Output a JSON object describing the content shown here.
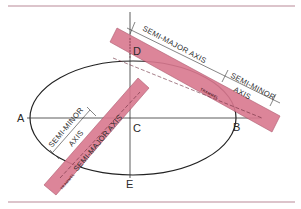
{
  "figure": {
    "colors": {
      "rule": "#b98a98",
      "trammel_fill": "#d9788f",
      "trammel_edge": "#a44a60",
      "ink": "#2a2a2a"
    }
  },
  "points": {
    "A": "A",
    "B": "B",
    "C": "C",
    "D": "D",
    "E": "E"
  },
  "upper_trammel": {
    "label": "TRAMMEL",
    "dim_semi_major": "SEMI-MAJOR AXIS",
    "dim_semi_minor_line1": "SEMI-MINOR",
    "dim_semi_minor_line2": "AXIS"
  },
  "lower_trammel": {
    "label": "TRAMMEL",
    "dim_semi_major": "SEMI-MAJOR AXIS",
    "dim_semi_minor_line1": "SEMI-MINOR",
    "dim_semi_minor_line2": "AXIS"
  }
}
